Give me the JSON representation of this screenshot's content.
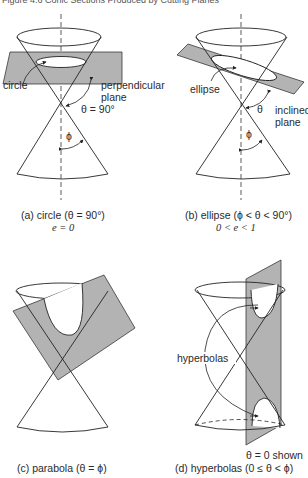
{
  "header": {
    "title": "Figure 4.6 Conic Sections Produced by Cutting Planes"
  },
  "panels": [
    {
      "id": "a",
      "labels": {
        "curve": "circle",
        "plane_line1": "perpendicular",
        "plane_line2": "plane",
        "angle": "θ = 90°",
        "phi": "ϕ"
      },
      "caption": {
        "line1": "(a) circle (θ = 90°)",
        "line2": "e = 0"
      }
    },
    {
      "id": "b",
      "labels": {
        "curve": "ellipse",
        "plane_line1": "inclined",
        "plane_line2": "plane",
        "angle": "θ",
        "phi": "ϕ"
      },
      "caption": {
        "line1": "(b) ellipse (ϕ < θ < 90°)",
        "line2": "0 < e < 1"
      }
    },
    {
      "id": "c",
      "labels": {},
      "caption": {
        "line1": "(c) parabola (θ = ϕ)"
      }
    },
    {
      "id": "d",
      "labels": {
        "curve": "hyperbolas",
        "note": "θ = 0 shown"
      },
      "caption": {
        "line1": "(d) hyperbolas (0 ≤ θ < ϕ)"
      }
    }
  ],
  "colors": {
    "plane_fill": "#b3b3b3",
    "line": "#222222",
    "background": "#ffffff"
  }
}
